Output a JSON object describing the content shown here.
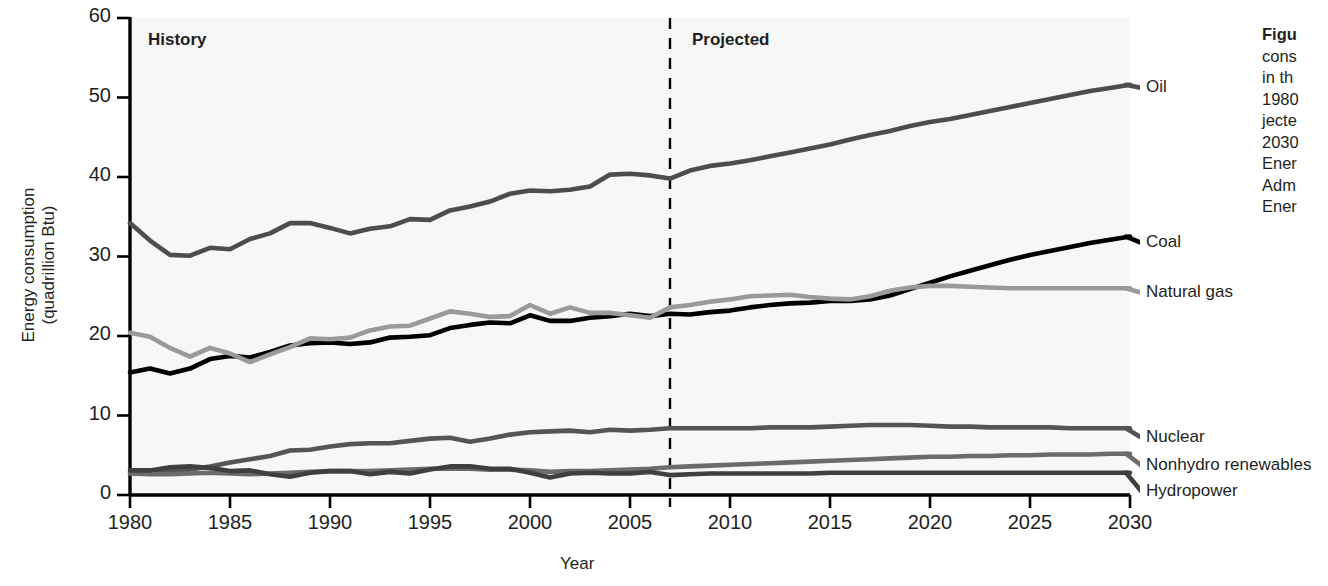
{
  "figure": {
    "caption_lines": [
      {
        "text": "Figu",
        "bold": true
      },
      {
        "text": "cons",
        "bold": false
      },
      {
        "text": "in th",
        "bold": false
      },
      {
        "text": "1980",
        "bold": false
      },
      {
        "text": "jecte",
        "bold": false
      },
      {
        "text": "2030",
        "bold": false
      },
      {
        "text": "Ener",
        "bold": false
      },
      {
        "text": "Adm",
        "bold": false
      },
      {
        "text": "Ener",
        "bold": false
      }
    ]
  },
  "annotations": {
    "history_label": "History",
    "projected_label": "Projected",
    "divider_year": 2007
  },
  "colors": {
    "oil": "#4d4d4d",
    "coal": "#000000",
    "natural_gas": "#9a9a9a",
    "nuclear": "#555555",
    "nonhydro_renewables": "#6b6b6b",
    "hydropower": "#3f3f3f",
    "axis": "#000000",
    "plot_background": "#f7f7f7",
    "text": "#231f20"
  },
  "chart_data": {
    "type": "line",
    "title": "",
    "xlabel": "Year",
    "ylabel": "Energy consumption\n(quadrillion Btu)",
    "xlim": [
      1980,
      2030
    ],
    "ylim": [
      0,
      60
    ],
    "xticks": [
      1980,
      1985,
      1990,
      1995,
      2000,
      2005,
      2010,
      2015,
      2020,
      2025,
      2030
    ],
    "yticks": [
      0,
      10,
      20,
      30,
      40,
      50,
      60
    ],
    "grid": false,
    "legend_position": "right-inline-labels",
    "x": [
      1980,
      1981,
      1982,
      1983,
      1984,
      1985,
      1986,
      1987,
      1988,
      1989,
      1990,
      1991,
      1992,
      1993,
      1994,
      1995,
      1996,
      1997,
      1998,
      1999,
      2000,
      2001,
      2002,
      2003,
      2004,
      2005,
      2006,
      2007,
      2008,
      2009,
      2010,
      2011,
      2012,
      2013,
      2014,
      2015,
      2016,
      2017,
      2018,
      2019,
      2020,
      2021,
      2022,
      2023,
      2024,
      2025,
      2026,
      2027,
      2028,
      2029,
      2030
    ],
    "series": [
      {
        "name": "Oil",
        "label": "Oil",
        "color": "#4d4d4d",
        "values": [
          34.2,
          32.0,
          30.2,
          30.1,
          31.1,
          30.9,
          32.2,
          32.9,
          34.2,
          34.2,
          33.6,
          32.9,
          33.5,
          33.8,
          34.7,
          34.6,
          35.8,
          36.3,
          36.9,
          37.9,
          38.3,
          38.2,
          38.4,
          38.8,
          40.3,
          40.4,
          40.2,
          39.8,
          40.8,
          41.4,
          41.7,
          42.1,
          42.6,
          43.1,
          43.6,
          44.1,
          44.7,
          45.3,
          45.8,
          46.4,
          46.9,
          47.3,
          47.8,
          48.3,
          48.8,
          49.3,
          49.8,
          50.3,
          50.8,
          51.2,
          51.6
        ]
      },
      {
        "name": "Coal",
        "label": "Coal",
        "color": "#000000",
        "values": [
          15.4,
          15.9,
          15.3,
          15.9,
          17.1,
          17.5,
          17.3,
          18.0,
          18.8,
          19.1,
          19.2,
          19.0,
          19.2,
          19.8,
          19.9,
          20.1,
          21.0,
          21.4,
          21.7,
          21.6,
          22.6,
          21.9,
          21.9,
          22.3,
          22.5,
          22.8,
          22.5,
          22.8,
          22.7,
          23.0,
          23.2,
          23.6,
          23.9,
          24.1,
          24.2,
          24.4,
          24.4,
          24.6,
          25.1,
          25.9,
          26.7,
          27.5,
          28.2,
          28.9,
          29.6,
          30.2,
          30.7,
          31.2,
          31.7,
          32.1,
          32.5
        ]
      },
      {
        "name": "Natural gas",
        "label": "Natural gas",
        "color": "#9a9a9a",
        "values": [
          20.4,
          19.9,
          18.5,
          17.4,
          18.5,
          17.8,
          16.7,
          17.7,
          18.6,
          19.7,
          19.6,
          19.8,
          20.7,
          21.2,
          21.3,
          22.2,
          23.1,
          22.8,
          22.4,
          22.5,
          23.9,
          22.8,
          23.6,
          22.9,
          22.9,
          22.6,
          22.3,
          23.6,
          23.9,
          24.3,
          24.6,
          25.0,
          25.1,
          25.2,
          24.9,
          24.7,
          24.6,
          25.0,
          25.7,
          26.1,
          26.3,
          26.3,
          26.2,
          26.1,
          26.0,
          26.0,
          26.0,
          26.0,
          26.0,
          26.0,
          26.0
        ]
      },
      {
        "name": "Nuclear",
        "label": "Nuclear",
        "color": "#555555",
        "values": [
          2.7,
          3.0,
          3.1,
          3.2,
          3.6,
          4.1,
          4.5,
          4.9,
          5.6,
          5.7,
          6.1,
          6.4,
          6.5,
          6.5,
          6.8,
          7.1,
          7.2,
          6.7,
          7.1,
          7.6,
          7.9,
          8.0,
          8.1,
          7.9,
          8.2,
          8.1,
          8.2,
          8.4,
          8.4,
          8.4,
          8.4,
          8.4,
          8.5,
          8.5,
          8.5,
          8.6,
          8.7,
          8.8,
          8.8,
          8.8,
          8.7,
          8.6,
          8.6,
          8.5,
          8.5,
          8.5,
          8.5,
          8.4,
          8.4,
          8.4,
          8.4
        ]
      },
      {
        "name": "Nonhydro renewables",
        "label": "Nonhydro renewables",
        "color": "#6b6b6b",
        "values": [
          2.7,
          2.6,
          2.6,
          2.7,
          2.8,
          2.7,
          2.6,
          2.7,
          2.8,
          2.9,
          3.0,
          3.0,
          3.0,
          3.1,
          3.2,
          3.3,
          3.3,
          3.3,
          3.2,
          3.2,
          3.1,
          2.9,
          3.0,
          3.0,
          3.1,
          3.2,
          3.3,
          3.5,
          3.6,
          3.7,
          3.8,
          3.9,
          4.0,
          4.1,
          4.2,
          4.3,
          4.4,
          4.5,
          4.6,
          4.7,
          4.8,
          4.8,
          4.9,
          4.9,
          5.0,
          5.0,
          5.1,
          5.1,
          5.1,
          5.2,
          5.2
        ]
      },
      {
        "name": "Hydropower",
        "label": "Hydropower",
        "color": "#3f3f3f",
        "values": [
          3.1,
          3.1,
          3.5,
          3.6,
          3.4,
          3.0,
          3.1,
          2.6,
          2.3,
          2.8,
          3.0,
          3.0,
          2.6,
          2.9,
          2.7,
          3.2,
          3.6,
          3.6,
          3.3,
          3.3,
          2.8,
          2.2,
          2.7,
          2.8,
          2.7,
          2.7,
          2.9,
          2.5,
          2.6,
          2.7,
          2.7,
          2.7,
          2.7,
          2.7,
          2.7,
          2.8,
          2.8,
          2.8,
          2.8,
          2.8,
          2.8,
          2.8,
          2.8,
          2.8,
          2.8,
          2.8,
          2.8,
          2.8,
          2.8,
          2.8,
          2.8
        ]
      }
    ]
  }
}
